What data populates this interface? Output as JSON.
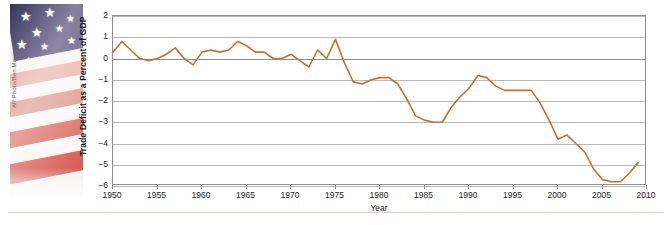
{
  "figure": {
    "photo": {
      "credit": "AP Photo/Ben Margot",
      "alt_name": "american-flag-photo"
    }
  },
  "chart_data": {
    "type": "line",
    "title": "",
    "xlabel": "Year",
    "ylabel": "Trade Deficit as a Percent of GDP",
    "xlim": [
      1950,
      2010
    ],
    "ylim": [
      -6,
      2
    ],
    "xticks": [
      1950,
      1955,
      1960,
      1965,
      1970,
      1975,
      1980,
      1985,
      1990,
      1995,
      2000,
      2005,
      2010
    ],
    "yticks": [
      2,
      1,
      0,
      -1,
      -2,
      -3,
      -4,
      -5,
      -6
    ],
    "ytick_labels": [
      "2",
      "1",
      "0",
      "-1",
      "-2",
      "-3",
      "-4",
      "-5",
      "-6"
    ],
    "xtick_labels": [
      "1950",
      "1955",
      "1960",
      "1965",
      "1970",
      "1975",
      "1980",
      "1985",
      "1990",
      "1995",
      "2000",
      "2005",
      "2010"
    ],
    "grid": true,
    "legend": false,
    "line_color": "#C3712E",
    "series": [
      {
        "name": "Trade balance as percent of GDP",
        "x": [
          1950,
          1951,
          1952,
          1953,
          1954,
          1955,
          1956,
          1957,
          1958,
          1959,
          1960,
          1961,
          1962,
          1963,
          1964,
          1965,
          1966,
          1967,
          1968,
          1969,
          1970,
          1971,
          1972,
          1973,
          1974,
          1975,
          1976,
          1977,
          1978,
          1979,
          1980,
          1981,
          1982,
          1983,
          1984,
          1985,
          1986,
          1987,
          1988,
          1989,
          1990,
          1991,
          1992,
          1993,
          1994,
          1995,
          1996,
          1997,
          1998,
          1999,
          2000,
          2001,
          2002,
          2003,
          2004,
          2005,
          2006,
          2007,
          2008,
          2009
        ],
        "values": [
          0.3,
          0.8,
          0.4,
          0.0,
          -0.1,
          0.0,
          0.2,
          0.5,
          0.0,
          -0.3,
          0.3,
          0.4,
          0.3,
          0.4,
          0.8,
          0.6,
          0.3,
          0.3,
          0.0,
          0.0,
          0.2,
          -0.1,
          -0.4,
          0.4,
          0.0,
          0.9,
          -0.2,
          -1.1,
          -1.2,
          -1.0,
          -0.9,
          -0.9,
          -1.2,
          -1.9,
          -2.7,
          -2.9,
          -3.0,
          -3.0,
          -2.3,
          -1.8,
          -1.4,
          -0.8,
          -0.9,
          -1.3,
          -1.5,
          -1.5,
          -1.5,
          -1.5,
          -2.1,
          -2.9,
          -3.8,
          -3.6,
          -4.0,
          -4.4,
          -5.2,
          -5.7,
          -5.8,
          -5.8,
          -5.4,
          -4.9
        ]
      }
    ]
  },
  "axis": {
    "x_title": "Year",
    "y_title": "Trade Deficit as a Percent of GDP"
  }
}
